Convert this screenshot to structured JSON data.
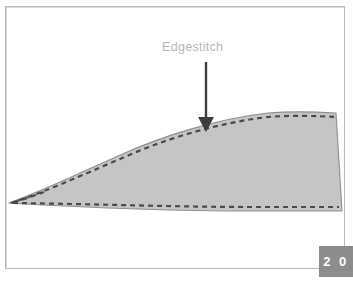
{
  "page": {
    "background_color": "#ffffff",
    "frame_border_color": "#b9b9b9",
    "width": 353,
    "height": 281
  },
  "illustration": {
    "title": "Edgestitch",
    "type": "sewing-diagram",
    "fabric": {
      "fill_color": "#c5c5c5",
      "outline_color": "#8f8f8f",
      "description": "tapered fabric piece"
    },
    "stitch": {
      "name": "edgestitch",
      "style": "dashed",
      "color": "#4a4a4a",
      "dash_length": 5,
      "dash_gap": 4,
      "stroke_width": 2.2
    },
    "annotation": {
      "label": "Edgestitch",
      "label_color": "#b6b6b6",
      "arrow_color": "#3d3d3d",
      "arrow_name": "down-arrow"
    }
  },
  "badge": {
    "page_number": "2 0",
    "background_color": "#8c8c8c",
    "text_color": "#ffffff"
  }
}
